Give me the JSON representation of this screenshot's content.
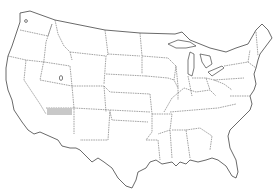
{
  "map": {
    "type": "us-states-outline",
    "background": "#ffffff",
    "line_color": "#444444",
    "highlight": {
      "region": "Northern Arizona",
      "color": "#c8c8c8",
      "x": 47,
      "y": 108,
      "width": 25,
      "height": 7
    }
  }
}
